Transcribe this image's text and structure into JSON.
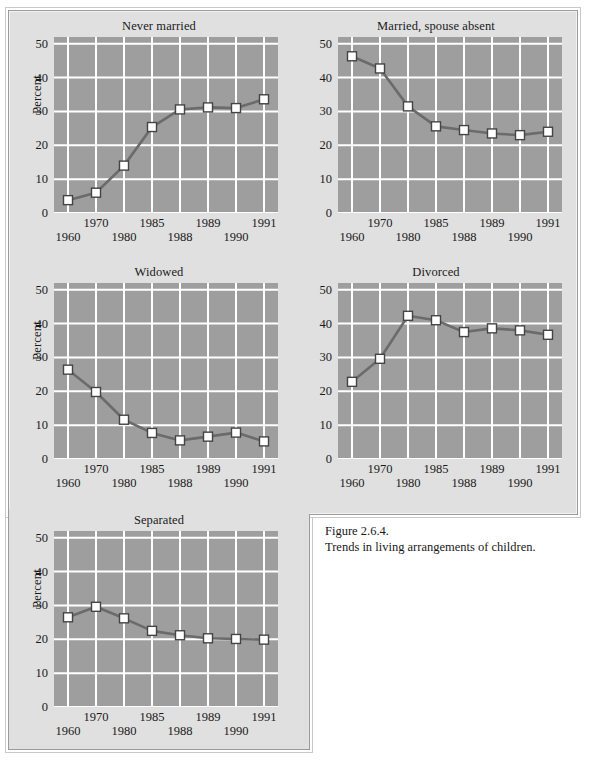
{
  "figure": {
    "caption_number": "Figure 2.6.4.",
    "caption_text": "Trends in living arrangements of children."
  },
  "style": {
    "panel_bg": "#e0e0e0",
    "plot_bg": "#9e9e9e",
    "grid_color": "#ffffff",
    "line_color": "#6b6b6b",
    "marker_fill": "#ffffff",
    "marker_stroke": "#444444",
    "text_color": "#1a1a1a",
    "page_bg": "#ffffff"
  },
  "chart_data": [
    {
      "type": "line",
      "title": "Never married",
      "xlabel": "",
      "ylabel": "Percent",
      "categories": [
        "1960",
        "1970",
        "1980",
        "1985",
        "1988",
        "1989",
        "1990",
        "1991"
      ],
      "values": [
        3.8,
        6.0,
        14.0,
        25.4,
        30.6,
        31.2,
        31.0,
        33.6
      ],
      "ylim": [
        0,
        52
      ],
      "yticks": [
        0,
        10,
        20,
        30,
        40,
        50
      ],
      "grid": true,
      "legend": "none"
    },
    {
      "type": "line",
      "title": "Married, spouse absent",
      "xlabel": "",
      "ylabel": "",
      "categories": [
        "1960",
        "1970",
        "1980",
        "1985",
        "1988",
        "1989",
        "1990",
        "1991"
      ],
      "values": [
        46.3,
        42.7,
        31.5,
        25.6,
        24.5,
        23.5,
        23.0,
        24.0
      ],
      "ylim": [
        0,
        52
      ],
      "yticks": [
        0,
        10,
        20,
        30,
        40,
        50
      ],
      "grid": true,
      "legend": "none"
    },
    {
      "type": "line",
      "title": "Widowed",
      "xlabel": "",
      "ylabel": "Percent",
      "categories": [
        "1960",
        "1970",
        "1980",
        "1985",
        "1988",
        "1989",
        "1990",
        "1991"
      ],
      "values": [
        26.4,
        19.8,
        11.6,
        7.7,
        5.5,
        6.6,
        7.8,
        5.2
      ],
      "ylim": [
        0,
        52
      ],
      "yticks": [
        0,
        10,
        20,
        30,
        40,
        50
      ],
      "grid": true,
      "legend": "none"
    },
    {
      "type": "line",
      "title": "Divorced",
      "xlabel": "",
      "ylabel": "",
      "categories": [
        "1960",
        "1970",
        "1980",
        "1985",
        "1988",
        "1989",
        "1990",
        "1991"
      ],
      "values": [
        22.8,
        29.6,
        42.3,
        41.0,
        37.5,
        38.6,
        38.0,
        36.7
      ],
      "ylim": [
        0,
        52
      ],
      "yticks": [
        0,
        10,
        20,
        30,
        40,
        50
      ],
      "grid": true,
      "legend": "none"
    },
    {
      "type": "line",
      "title": "Separated",
      "xlabel": "",
      "ylabel": "Percent",
      "categories": [
        "1960",
        "1970",
        "1980",
        "1985",
        "1988",
        "1989",
        "1990",
        "1991"
      ],
      "values": [
        26.5,
        29.6,
        26.2,
        22.5,
        21.2,
        20.3,
        20.1,
        19.9
      ],
      "ylim": [
        0,
        52
      ],
      "yticks": [
        0,
        10,
        20,
        30,
        40,
        50
      ],
      "grid": true,
      "legend": "none"
    }
  ]
}
